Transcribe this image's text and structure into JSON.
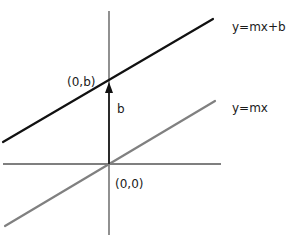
{
  "diagram": {
    "colors": {
      "background": "#ffffff",
      "axis": "#555555",
      "line_shifted": "#111111",
      "line_base": "#808080",
      "arrow": "#111111",
      "text": "#1a1a1a"
    },
    "axes": {
      "origin_px": [
        109,
        164
      ],
      "x_axis": {
        "from": [
          3,
          164
        ],
        "to": [
          221,
          164
        ]
      },
      "y_axis": {
        "from": [
          109,
          11
        ],
        "to": [
          109,
          235
        ]
      }
    },
    "lines": [
      {
        "id": "shifted",
        "label": "y=mx+b",
        "from": [
          3,
          142
        ],
        "to": [
          213,
          19
        ],
        "label_pos": [
          232,
          31
        ]
      },
      {
        "id": "base",
        "label": "y=mx",
        "from": [
          5,
          226
        ],
        "to": [
          215,
          101
        ],
        "label_pos": [
          232,
          112
        ]
      }
    ],
    "arrow": {
      "label": "b",
      "from": [
        109,
        164
      ],
      "to": [
        109,
        82
      ],
      "label_pos": [
        117,
        113
      ]
    },
    "points": [
      {
        "label": "(0,b)",
        "pos": [
          109,
          80
        ],
        "label_pos": [
          67,
          86
        ]
      },
      {
        "label": "(0,0)",
        "pos": [
          109,
          164
        ],
        "label_pos": [
          115,
          188
        ]
      }
    ]
  }
}
